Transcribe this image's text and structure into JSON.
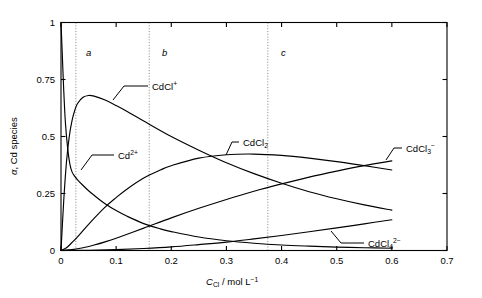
{
  "chart_data": {
    "type": "line",
    "title": "",
    "xlabel": "C_Cl / mol L^-1",
    "ylabel": "alpha, Cd species",
    "xlim": [
      0,
      0.7
    ],
    "ylim": [
      0,
      1
    ],
    "grid": false,
    "legend_position": "inline-annotations",
    "x_ticks": [
      "0",
      "0.1",
      "0.2",
      "0.3",
      "0.4",
      "0.5",
      "0.6",
      "0.7"
    ],
    "x_tick_values": [
      0,
      0.1,
      0.2,
      0.3,
      0.4,
      0.5,
      0.6,
      0.7
    ],
    "y_ticks": [
      "0",
      "0.25",
      "0.5",
      "0.75",
      "1"
    ],
    "y_tick_values": [
      0,
      0.25,
      0.5,
      0.75,
      1
    ],
    "annotations": [
      {
        "label": "a",
        "x": 0.027,
        "type": "vertical-dotted-line"
      },
      {
        "label": "b",
        "x": 0.16,
        "type": "vertical-dotted-line"
      },
      {
        "label": "c",
        "x": 0.375,
        "type": "vertical-dotted-line"
      }
    ],
    "series": [
      {
        "name": "Cd2+",
        "label_html": "Cd<sup>2+</sup>",
        "x": [
          0,
          0.002,
          0.005,
          0.008,
          0.012,
          0.016,
          0.02,
          0.025,
          0.03,
          0.04,
          0.05,
          0.06,
          0.08,
          0.1,
          0.12,
          0.15,
          0.18,
          0.2,
          0.25,
          0.3,
          0.35,
          0.4,
          0.45,
          0.5,
          0.55,
          0.6
        ],
        "values": [
          1.0,
          0.88,
          0.7,
          0.56,
          0.45,
          0.38,
          0.345,
          0.325,
          0.31,
          0.285,
          0.262,
          0.242,
          0.205,
          0.175,
          0.15,
          0.118,
          0.095,
          0.083,
          0.059,
          0.043,
          0.032,
          0.024,
          0.019,
          0.015,
          0.012,
          0.01
        ]
      },
      {
        "name": "CdCl+",
        "label_html": "CdCl<sup>+</sup>",
        "x": [
          0,
          0.005,
          0.01,
          0.015,
          0.02,
          0.025,
          0.03,
          0.04,
          0.05,
          0.06,
          0.08,
          0.1,
          0.12,
          0.15,
          0.2,
          0.25,
          0.3,
          0.35,
          0.4,
          0.45,
          0.5,
          0.55,
          0.6
        ],
        "values": [
          0.0,
          0.22,
          0.39,
          0.5,
          0.57,
          0.615,
          0.645,
          0.672,
          0.68,
          0.677,
          0.66,
          0.636,
          0.61,
          0.568,
          0.5,
          0.44,
          0.385,
          0.337,
          0.295,
          0.258,
          0.227,
          0.2,
          0.177
        ]
      },
      {
        "name": "CdCl2",
        "label_html": "CdCl<sub>2</sub>",
        "x": [
          0,
          0.01,
          0.02,
          0.03,
          0.05,
          0.08,
          0.1,
          0.12,
          0.15,
          0.18,
          0.2,
          0.25,
          0.3,
          0.35,
          0.4,
          0.45,
          0.5,
          0.55,
          0.6
        ],
        "values": [
          0.0,
          0.012,
          0.035,
          0.06,
          0.115,
          0.19,
          0.232,
          0.27,
          0.318,
          0.353,
          0.372,
          0.405,
          0.42,
          0.423,
          0.417,
          0.405,
          0.39,
          0.372,
          0.353
        ]
      },
      {
        "name": "CdCl3-",
        "label_html": "CdCl<sub>3</sub><sup>−</sup>",
        "x": [
          0,
          0.02,
          0.04,
          0.06,
          0.08,
          0.1,
          0.15,
          0.2,
          0.25,
          0.3,
          0.35,
          0.4,
          0.45,
          0.5,
          0.55,
          0.6
        ],
        "values": [
          0.0,
          0.004,
          0.012,
          0.024,
          0.038,
          0.054,
          0.098,
          0.143,
          0.185,
          0.224,
          0.26,
          0.292,
          0.322,
          0.348,
          0.372,
          0.393
        ]
      },
      {
        "name": "CdCl4 2-",
        "label_html": "CdCl<sub>4</sub><sup>2−</sup>",
        "x": [
          0,
          0.05,
          0.1,
          0.15,
          0.2,
          0.25,
          0.3,
          0.35,
          0.4,
          0.45,
          0.5,
          0.55,
          0.6
        ],
        "values": [
          0.0,
          0.001,
          0.004,
          0.009,
          0.016,
          0.026,
          0.037,
          0.051,
          0.066,
          0.082,
          0.099,
          0.117,
          0.135
        ]
      }
    ]
  },
  "axes": {
    "y_label_parts": {
      "alpha": "α",
      "rest": ", Cd species"
    },
    "x_label_parts": {
      "c": "C",
      "sub": "Cl",
      "units": " / mol L",
      "exp": "−1"
    }
  },
  "series_labels": {
    "cd2": {
      "base": "Cd",
      "sup": "2+"
    },
    "cdcl1": {
      "base": "CdCl",
      "sup": "+"
    },
    "cdcl2": {
      "base": "CdCl",
      "sub": "2"
    },
    "cdcl3": {
      "base": "CdCl",
      "sub": "3",
      "sup": "−"
    },
    "cdcl4": {
      "base": "CdCl",
      "sub": "4",
      "sup": "2−"
    }
  },
  "marks": {
    "a": "a",
    "b": "b",
    "c": "c"
  },
  "colors": {
    "axis": "#000000",
    "curve": "#000000",
    "dotted": "#8c8c8c",
    "background": "#ffffff"
  }
}
